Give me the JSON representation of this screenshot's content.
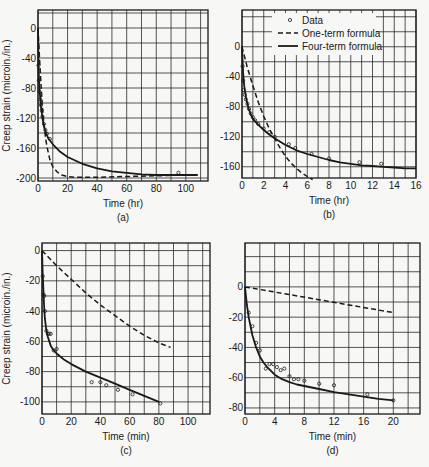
{
  "figure": {
    "legend": {
      "data_label": "Data",
      "one_term_label": "One-term formula",
      "four_term_label": "Four-term formula"
    },
    "bottom_fragment": ""
  },
  "chart_data": [
    {
      "id": "a",
      "type": "line",
      "panel_label": "(a)",
      "xlabel": "Time (hr)",
      "ylabel": "Creep strain (microin./in.)",
      "xticks": [
        0,
        20,
        40,
        60,
        80,
        100
      ],
      "yticks": [
        0,
        -40,
        -80,
        -120,
        -160,
        -200
      ],
      "xlim": [
        0,
        115
      ],
      "ylim": [
        -204,
        24
      ],
      "grid": {
        "x_step": 10,
        "y_step": 20
      },
      "series": [
        {
          "name": "Four-term formula",
          "style": "solid",
          "x": [
            0,
            0.5,
            1,
            2,
            3,
            4,
            5,
            7,
            10,
            15,
            20,
            30,
            40,
            50,
            60,
            70,
            80,
            90,
            100,
            108
          ],
          "y": [
            0,
            -60,
            -82,
            -105,
            -120,
            -130,
            -138,
            -147,
            -155,
            -165,
            -172,
            -181,
            -187,
            -191,
            -193,
            -195,
            -196,
            -196,
            -196,
            -196
          ]
        },
        {
          "name": "One-term formula",
          "style": "dashed",
          "x": [
            0,
            1,
            2,
            3,
            4,
            5,
            6,
            8,
            10,
            13,
            16,
            20,
            25,
            30,
            40,
            60,
            80,
            100,
            108
          ],
          "y": [
            0,
            -40,
            -75,
            -105,
            -128,
            -145,
            -158,
            -175,
            -185,
            -192,
            -196,
            -198,
            -199,
            -199,
            -199,
            -198,
            -197,
            -196,
            -196
          ]
        },
        {
          "name": "Data",
          "style": "markers",
          "x": [
            0.3,
            0.6,
            1,
            1.5,
            2,
            2.5,
            3,
            4,
            5,
            6,
            8,
            95
          ],
          "y": [
            -50,
            -70,
            -85,
            -95,
            -103,
            -110,
            -118,
            -128,
            -136,
            -141,
            -148,
            -193
          ]
        }
      ]
    },
    {
      "id": "b",
      "type": "line",
      "panel_label": "(b)",
      "xlabel": "Time (hr)",
      "ylabel": "",
      "xticks": [
        0,
        2,
        4,
        6,
        8,
        10,
        12,
        14,
        16
      ],
      "yticks": [
        0,
        -40,
        -80,
        -120,
        -160
      ],
      "xlim": [
        0,
        16
      ],
      "ylim": [
        -175,
        49
      ],
      "grid": {
        "x_step": 1,
        "y_step": 20
      },
      "legend_position": "upper right",
      "series": [
        {
          "name": "Four-term formula",
          "style": "solid",
          "x": [
            0,
            0.1,
            0.2,
            0.4,
            0.6,
            0.8,
            1,
            1.5,
            2,
            2.5,
            3,
            4,
            5,
            6,
            7,
            8,
            9,
            10,
            11,
            12,
            13,
            14,
            15,
            16
          ],
          "y": [
            0,
            -35,
            -52,
            -70,
            -82,
            -90,
            -96,
            -104,
            -111,
            -117,
            -122,
            -131,
            -138,
            -143,
            -147,
            -151,
            -154,
            -156,
            -158,
            -159,
            -160,
            -161,
            -162,
            -162
          ]
        },
        {
          "name": "One-term formula",
          "style": "dashed",
          "x": [
            0,
            0.5,
            1,
            1.5,
            2,
            2.5,
            3,
            3.5,
            4,
            4.5,
            5,
            5.5,
            6,
            6.5
          ],
          "y": [
            0,
            -28,
            -52,
            -74,
            -93,
            -109,
            -122,
            -135,
            -146,
            -155,
            -162,
            -168,
            -173,
            -177
          ]
        },
        {
          "name": "Data",
          "style": "markers",
          "x": [
            0.05,
            0.1,
            0.15,
            0.25,
            0.35,
            0.5,
            0.65,
            0.8,
            1,
            1.2,
            1.5,
            2,
            2.5,
            3,
            4.3,
            4.9,
            6.4,
            8,
            10.8,
            12.8
          ],
          "y": [
            -26,
            -45,
            -58,
            -64,
            -70,
            -76,
            -83,
            -89,
            -94,
            -98,
            -103,
            -109,
            -114,
            -120,
            -130,
            -135,
            -143,
            -149,
            -154,
            -156
          ]
        }
      ]
    },
    {
      "id": "c",
      "type": "line",
      "panel_label": "(c)",
      "xlabel": "Time (min)",
      "ylabel": "Creep strain (microin./in.)",
      "xticks": [
        0,
        20,
        40,
        60,
        80,
        100
      ],
      "yticks": [
        0,
        -20,
        -40,
        -60,
        -80,
        -100
      ],
      "xlim": [
        0,
        115
      ],
      "ylim": [
        -108,
        5
      ],
      "grid": {
        "x_step": 10,
        "y_step": 10
      },
      "series": [
        {
          "name": "Four-term formula",
          "style": "solid",
          "x": [
            0,
            0.5,
            1,
            1.5,
            2,
            3,
            4,
            5,
            6,
            8,
            10,
            15,
            20,
            30,
            40,
            50,
            60,
            70,
            80
          ],
          "y": [
            0,
            -15,
            -28,
            -38,
            -45,
            -53,
            -57,
            -60,
            -63,
            -66,
            -68,
            -72,
            -75,
            -80,
            -84,
            -88,
            -92,
            -96,
            -100
          ]
        },
        {
          "name": "One-term formula",
          "style": "dashed",
          "x": [
            0,
            10,
            20,
            30,
            40,
            50,
            60,
            70,
            80,
            88
          ],
          "y": [
            0,
            -10,
            -19,
            -28,
            -36,
            -43,
            -50,
            -56,
            -61,
            -64
          ]
        },
        {
          "name": "Data",
          "style": "markers",
          "x": [
            0.5,
            1,
            1.5,
            2,
            3,
            4,
            5,
            6,
            8,
            10,
            34,
            40,
            44,
            52,
            62,
            81
          ],
          "y": [
            -17,
            -29,
            -30,
            -40,
            -53,
            -55,
            -55,
            -55,
            -66,
            -65,
            -87,
            -87,
            -89,
            -92,
            -95,
            -101
          ]
        }
      ]
    },
    {
      "id": "d",
      "type": "line",
      "panel_label": "(d)",
      "xlabel": "Time (min)",
      "ylabel": "",
      "xticks": [
        0,
        4,
        8,
        12,
        16,
        20
      ],
      "yticks": [
        0,
        -20,
        -40,
        -60,
        -80
      ],
      "xlim": [
        0,
        23.6
      ],
      "ylim": [
        -84,
        29
      ],
      "grid": {
        "x_step": 2,
        "y_step": 10
      },
      "series": [
        {
          "name": "Four-term formula",
          "style": "solid",
          "x": [
            0,
            0.25,
            0.5,
            1,
            1.5,
            2,
            2.5,
            3,
            4,
            5,
            6,
            7,
            8,
            10,
            12,
            14,
            16,
            18,
            20
          ],
          "y": [
            0,
            -12,
            -20,
            -32,
            -40,
            -46,
            -50,
            -53,
            -58,
            -61,
            -63,
            -64.5,
            -65.5,
            -67.5,
            -69.5,
            -71,
            -72.5,
            -74,
            -75
          ]
        },
        {
          "name": "One-term formula",
          "style": "dashed",
          "x": [
            0,
            20
          ],
          "y": [
            0,
            -17
          ]
        },
        {
          "name": "Data",
          "style": "markers",
          "x": [
            0.5,
            1,
            1.5,
            2,
            2.8,
            3.3,
            3.8,
            4.3,
            4.8,
            5.3,
            6,
            6.6,
            7.2,
            8,
            10,
            12,
            16.5,
            20
          ],
          "y": [
            -17,
            -26,
            -37,
            -42,
            -54,
            -51,
            -51,
            -53,
            -55,
            -54,
            -59,
            -61,
            -61,
            -62,
            -64,
            -65,
            -71,
            -75
          ]
        }
      ]
    }
  ],
  "layout": {
    "panels": {
      "a": {
        "left": 38,
        "top": 10,
        "right": 208,
        "bottom": 181
      },
      "b": {
        "left": 242,
        "top": 10,
        "right": 416,
        "bottom": 178
      },
      "c": {
        "left": 42,
        "top": 243,
        "right": 210,
        "bottom": 414
      },
      "d": {
        "left": 245,
        "top": 243,
        "right": 420,
        "bottom": 414
      }
    },
    "colors": {
      "ink": "#1a1a1a",
      "grid": "#2a2a2a",
      "background": "#f7f7f5"
    }
  }
}
